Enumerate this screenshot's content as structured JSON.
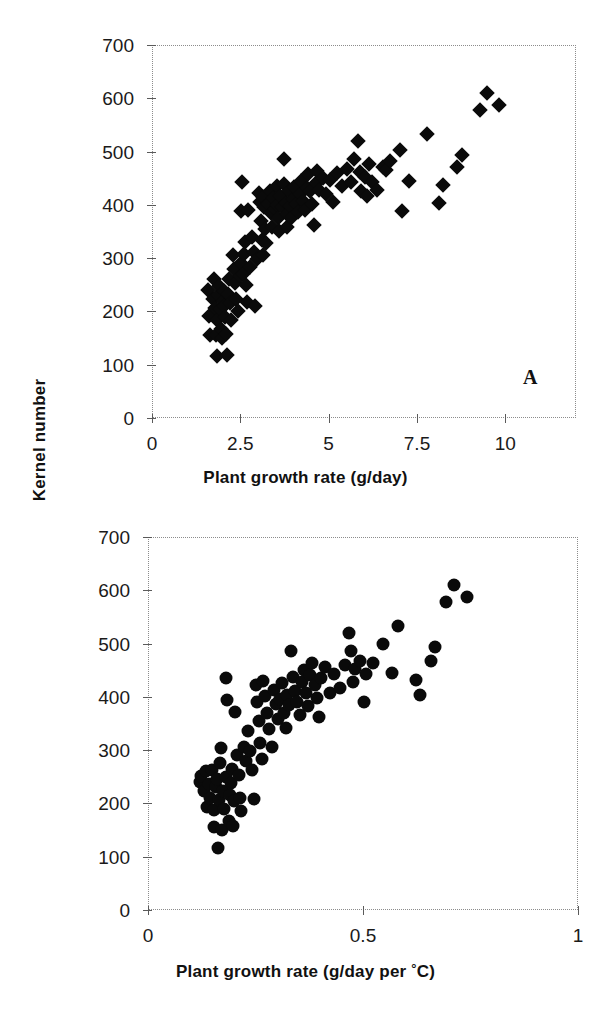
{
  "figure": {
    "y_axis_title": "Kernel number",
    "background": "#ffffff",
    "marker_color": "#0a0a0a",
    "axis_color": "#8c8c8c"
  },
  "panel_a": {
    "tag": "A",
    "x_axis_title_prefix": "Plant growth rate (g/day)",
    "x_ticks": [
      "0",
      "2.5",
      "5",
      "7.5",
      "10"
    ],
    "y_ticks": [
      "0",
      "100",
      "200",
      "300",
      "400",
      "500",
      "600",
      "700"
    ]
  },
  "panel_b": {
    "tag": "B",
    "x_axis_title_prefix": "Plant growth rate (g/day per ",
    "x_axis_title_degree": "°",
    "x_axis_title_suffix": "C)",
    "x_ticks": [
      "0",
      "0.5",
      "1"
    ],
    "y_ticks": [
      "0",
      "100",
      "200",
      "300",
      "400",
      "500",
      "600",
      "700"
    ]
  },
  "chart_data": [
    {
      "type": "scatter",
      "id": "A",
      "title": "",
      "xlabel": "Plant growth rate (g/day)",
      "ylabel": "Kernel number",
      "xlim": [
        0,
        12
      ],
      "ylim": [
        0,
        700
      ],
      "xticks": [
        0,
        2.5,
        5,
        7.5,
        10
      ],
      "yticks": [
        0,
        100,
        200,
        300,
        400,
        500,
        600,
        700
      ],
      "grid": false,
      "legend": null,
      "marker": "diamond",
      "marker_color": "#0a0a0a",
      "annotations": [
        {
          "text": "A",
          "x": 9.8,
          "y": 65
        }
      ],
      "points": [
        [
          1.55,
          243
        ],
        [
          1.58,
          193
        ],
        [
          1.62,
          157
        ],
        [
          1.7,
          226
        ],
        [
          1.72,
          262
        ],
        [
          1.75,
          208
        ],
        [
          1.78,
          158
        ],
        [
          1.8,
          118
        ],
        [
          1.82,
          186
        ],
        [
          1.85,
          232
        ],
        [
          1.88,
          250
        ],
        [
          1.9,
          207
        ],
        [
          1.92,
          168
        ],
        [
          1.95,
          152
        ],
        [
          1.98,
          222
        ],
        [
          2.0,
          240
        ],
        [
          2.02,
          212
        ],
        [
          2.05,
          191
        ],
        [
          2.08,
          160
        ],
        [
          2.1,
          120
        ],
        [
          2.12,
          235
        ],
        [
          2.15,
          262
        ],
        [
          2.18,
          217
        ],
        [
          2.2,
          186
        ],
        [
          2.25,
          308
        ],
        [
          2.28,
          281
        ],
        [
          2.32,
          256
        ],
        [
          2.35,
          226
        ],
        [
          2.4,
          202
        ],
        [
          2.45,
          268
        ],
        [
          2.48,
          293
        ],
        [
          2.5,
          390
        ],
        [
          2.52,
          444
        ],
        [
          2.55,
          272
        ],
        [
          2.58,
          309
        ],
        [
          2.6,
          333
        ],
        [
          2.62,
          251
        ],
        [
          2.65,
          219
        ],
        [
          2.7,
          392
        ],
        [
          2.75,
          286
        ],
        [
          2.8,
          341
        ],
        [
          2.85,
          313
        ],
        [
          2.9,
          212
        ],
        [
          2.95,
          300
        ],
        [
          3.0,
          424
        ],
        [
          3.02,
          408
        ],
        [
          3.05,
          372
        ],
        [
          3.08,
          336
        ],
        [
          3.1,
          308
        ],
        [
          3.12,
          416
        ],
        [
          3.15,
          398
        ],
        [
          3.18,
          357
        ],
        [
          3.2,
          330
        ],
        [
          3.25,
          403
        ],
        [
          3.3,
          428
        ],
        [
          3.35,
          386
        ],
        [
          3.38,
          360
        ],
        [
          3.4,
          415
        ],
        [
          3.45,
          395
        ],
        [
          3.5,
          438
        ],
        [
          3.52,
          402
        ],
        [
          3.55,
          377
        ],
        [
          3.58,
          352
        ],
        [
          3.6,
          419
        ],
        [
          3.65,
          398
        ],
        [
          3.7,
          487
        ],
        [
          3.72,
          441
        ],
        [
          3.75,
          406
        ],
        [
          3.78,
          385
        ],
        [
          3.8,
          360
        ],
        [
          3.85,
          427
        ],
        [
          3.88,
          399
        ],
        [
          3.9,
          378
        ],
        [
          3.95,
          412
        ],
        [
          4.0,
          436
        ],
        [
          4.05,
          404
        ],
        [
          4.1,
          388
        ],
        [
          4.15,
          422
        ],
        [
          4.2,
          446
        ],
        [
          4.25,
          410
        ],
        [
          4.3,
          392
        ],
        [
          4.35,
          434
        ],
        [
          4.4,
          460
        ],
        [
          4.45,
          428
        ],
        [
          4.5,
          404
        ],
        [
          4.55,
          365
        ],
        [
          4.6,
          443
        ],
        [
          4.65,
          466
        ],
        [
          4.7,
          430
        ],
        [
          4.8,
          452
        ],
        [
          4.9,
          423
        ],
        [
          5.0,
          449
        ],
        [
          5.1,
          408
        ],
        [
          5.2,
          461
        ],
        [
          5.35,
          437
        ],
        [
          5.5,
          470
        ],
        [
          5.6,
          445
        ],
        [
          5.7,
          488
        ],
        [
          5.8,
          521
        ],
        [
          5.85,
          463
        ],
        [
          5.9,
          428
        ],
        [
          6.0,
          455
        ],
        [
          6.05,
          419
        ],
        [
          6.1,
          479
        ],
        [
          6.2,
          445
        ],
        [
          6.35,
          430
        ],
        [
          6.5,
          472
        ],
        [
          6.6,
          468
        ],
        [
          6.7,
          485
        ],
        [
          7.0,
          504
        ],
        [
          7.05,
          390
        ],
        [
          7.25,
          447
        ],
        [
          7.75,
          535
        ],
        [
          8.1,
          405
        ],
        [
          8.2,
          440
        ],
        [
          8.6,
          472
        ],
        [
          8.75,
          495
        ],
        [
          9.25,
          580
        ],
        [
          9.45,
          611
        ],
        [
          9.8,
          590
        ]
      ]
    },
    {
      "type": "scatter",
      "id": "B",
      "title": "",
      "xlabel": "Plant growth rate (g/day per °C)",
      "ylabel": "Kernel number",
      "xlim": [
        0,
        1
      ],
      "ylim": [
        0,
        700
      ],
      "xticks": [
        0,
        0.5,
        1
      ],
      "yticks": [
        0,
        100,
        200,
        300,
        400,
        500,
        600,
        700
      ],
      "grid": false,
      "legend": null,
      "marker": "circle",
      "marker_color": "#0a0a0a",
      "annotations": [
        {
          "text": "B",
          "x": 0.885,
          "y": 65
        }
      ],
      "points": [
        [
          0.118,
          243
        ],
        [
          0.122,
          254
        ],
        [
          0.128,
          226
        ],
        [
          0.132,
          262
        ],
        [
          0.136,
          196
        ],
        [
          0.14,
          238
        ],
        [
          0.143,
          212
        ],
        [
          0.146,
          264
        ],
        [
          0.15,
          190
        ],
        [
          0.152,
          158
        ],
        [
          0.155,
          232
        ],
        [
          0.158,
          248
        ],
        [
          0.16,
          118
        ],
        [
          0.162,
          208
        ],
        [
          0.165,
          277
        ],
        [
          0.168,
          306
        ],
        [
          0.17,
          152
        ],
        [
          0.172,
          225
        ],
        [
          0.175,
          192
        ],
        [
          0.178,
          252
        ],
        [
          0.18,
          437
        ],
        [
          0.182,
          396
        ],
        [
          0.185,
          168
        ],
        [
          0.188,
          218
        ],
        [
          0.19,
          240
        ],
        [
          0.193,
          266
        ],
        [
          0.196,
          160
        ],
        [
          0.198,
          207
        ],
        [
          0.2,
          374
        ],
        [
          0.205,
          292
        ],
        [
          0.21,
          256
        ],
        [
          0.212,
          212
        ],
        [
          0.215,
          187
        ],
        [
          0.22,
          307
        ],
        [
          0.225,
          281
        ],
        [
          0.23,
          338
        ],
        [
          0.235,
          300
        ],
        [
          0.24,
          264
        ],
        [
          0.245,
          210
        ],
        [
          0.248,
          424
        ],
        [
          0.25,
          392
        ],
        [
          0.255,
          356
        ],
        [
          0.258,
          316
        ],
        [
          0.262,
          286
        ],
        [
          0.265,
          432
        ],
        [
          0.27,
          404
        ],
        [
          0.275,
          372
        ],
        [
          0.28,
          341
        ],
        [
          0.285,
          308
        ],
        [
          0.29,
          415
        ],
        [
          0.295,
          388
        ],
        [
          0.3,
          360
        ],
        [
          0.305,
          398
        ],
        [
          0.31,
          428
        ],
        [
          0.315,
          371
        ],
        [
          0.318,
          344
        ],
        [
          0.322,
          405
        ],
        [
          0.325,
          386
        ],
        [
          0.33,
          487
        ],
        [
          0.335,
          440
        ],
        [
          0.34,
          413
        ],
        [
          0.345,
          392
        ],
        [
          0.35,
          368
        ],
        [
          0.355,
          430
        ],
        [
          0.36,
          452
        ],
        [
          0.365,
          409
        ],
        [
          0.37,
          385
        ],
        [
          0.375,
          443
        ],
        [
          0.38,
          466
        ],
        [
          0.385,
          425
        ],
        [
          0.39,
          400
        ],
        [
          0.395,
          364
        ],
        [
          0.4,
          437
        ],
        [
          0.41,
          458
        ],
        [
          0.42,
          410
        ],
        [
          0.43,
          444
        ],
        [
          0.445,
          418
        ],
        [
          0.455,
          462
        ],
        [
          0.465,
          521
        ],
        [
          0.47,
          488
        ],
        [
          0.475,
          430
        ],
        [
          0.48,
          455
        ],
        [
          0.49,
          470
        ],
        [
          0.5,
          392
        ],
        [
          0.505,
          445
        ],
        [
          0.52,
          466
        ],
        [
          0.545,
          502
        ],
        [
          0.565,
          447
        ],
        [
          0.58,
          535
        ],
        [
          0.62,
          434
        ],
        [
          0.63,
          405
        ],
        [
          0.655,
          470
        ],
        [
          0.665,
          495
        ],
        [
          0.69,
          580
        ],
        [
          0.71,
          611
        ],
        [
          0.74,
          590
        ]
      ]
    }
  ]
}
